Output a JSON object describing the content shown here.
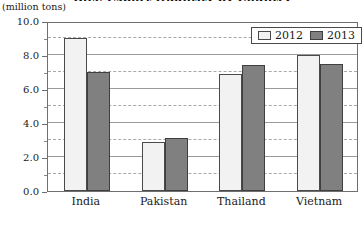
{
  "title": "Rice Export Quantity by Country",
  "unit_label": "(million tons)",
  "legend": {
    "position": "top-right",
    "entries": [
      {
        "label": "2012",
        "color": "#f2f2f2"
      },
      {
        "label": "2013",
        "color": "#808080"
      }
    ]
  },
  "chart_data": {
    "type": "bar",
    "title": "Rice Export Quantity by Country",
    "xlabel": "",
    "ylabel": "(million tons)",
    "ylim": [
      0.0,
      10.0
    ],
    "ytick_labels": [
      "0.0",
      "2.0",
      "4.0",
      "6.0",
      "8.0",
      "10.0"
    ],
    "ytick_values": [
      0.0,
      2.0,
      4.0,
      6.0,
      8.0,
      10.0
    ],
    "minor_gridline_values": [
      1.0,
      3.0,
      5.0,
      7.0,
      9.0
    ],
    "grid": true,
    "categories": [
      "India",
      "Pakistan",
      "Thailand",
      "Vietnam"
    ],
    "series": [
      {
        "name": "2012",
        "color": "#f2f2f2",
        "values": [
          9.0,
          2.9,
          6.9,
          8.0
        ]
      },
      {
        "name": "2013",
        "color": "#808080",
        "values": [
          7.0,
          3.1,
          7.4,
          7.5
        ]
      }
    ],
    "legend_position": "top-right"
  }
}
